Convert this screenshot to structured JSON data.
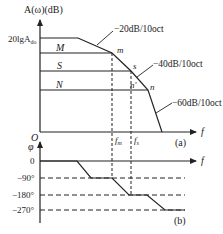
{
  "magnitude_plot": {
    "y_axis_label": "A(ω)(dB)",
    "y_tick_label": "20lgA",
    "y_tick_sub": "do",
    "origin_label": "O",
    "x_axis_label": "f",
    "level_labels": [
      "M",
      "S",
      "N"
    ],
    "point_labels": [
      "m",
      "s",
      "n'",
      "n"
    ],
    "slope_labels": [
      "−20dB/10oct",
      "−40dB/10oct",
      "−60dB/10oct"
    ],
    "freq_labels": [
      "f",
      "f"
    ],
    "freq_subs": [
      "m",
      "s"
    ],
    "panel_label": "(a)"
  },
  "phase_plot": {
    "y_axis_label": "φ",
    "x_axis_label": "f",
    "y_tick_labels": [
      "0",
      "−90°",
      "−180°",
      "−270°"
    ],
    "panel_label": "(b)"
  },
  "colors": {
    "line": "#222222",
    "background": "#ffffff"
  }
}
